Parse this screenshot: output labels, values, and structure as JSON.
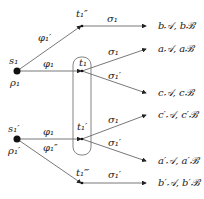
{
  "nodes": {
    "s1": {
      "label": "s₁",
      "sub": "ρ₁"
    },
    "s1p": {
      "label": "s₁′",
      "sub": "ρ₁′"
    },
    "t1pp": {
      "label": "t₁″"
    },
    "t1": {
      "label": "t₁"
    },
    "t1p": {
      "label": "t₁′"
    },
    "t1ppp": {
      "label": "t₁‴"
    }
  },
  "edges": {
    "s1_t1pp": "φ₁′",
    "s1_t1": "φ₁",
    "s1p_t1p": "φ₁",
    "s1p_t1ppp": "φ₁″",
    "t1pp_b": "σ₁",
    "t1_a": "σ₁",
    "t1_c": "σ₁′",
    "t1p_cp": "σ₁",
    "t1p_ap": "σ₁′",
    "t1ppp_bp": "σ₁′"
  },
  "outcomes": {
    "b": "b𝒜, bℬ",
    "a": "a𝒜, aℬ",
    "c": "c𝒜, cℬ",
    "cp": "c′𝒜, c′ℬ",
    "ap": "a′𝒜, a′ℬ",
    "bp": "b′𝒜, b′ℬ"
  }
}
